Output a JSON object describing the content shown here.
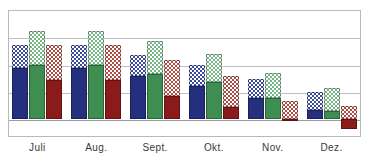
{
  "chart_data": {
    "type": "bar",
    "title": "",
    "subtitle": "",
    "xlabel": "",
    "ylabel": "",
    "categories": [
      "Juli",
      "Aug.",
      "Sept.",
      "Okt.",
      "Nov.",
      "Dez."
    ],
    "grid": true,
    "legend_position": "none",
    "ylim": [
      -0.6,
      4.6
    ],
    "gridline_values": [
      4.6,
      3.6,
      2.6,
      1.6,
      0.6,
      -0.6
    ],
    "zero_baseline": 0,
    "stacked": true,
    "series": [
      {
        "name": "blue-solid",
        "color": "#24307e",
        "pattern": "solid",
        "values": [
          2.1,
          2.1,
          1.75,
          1.35,
          0.85,
          0.37
        ]
      },
      {
        "name": "blue-checkered",
        "color": "#3a4a9c",
        "pattern": "checkered",
        "values": [
          0.93,
          0.93,
          0.88,
          0.85,
          0.8,
          0.74
        ]
      },
      {
        "name": "green-solid",
        "color": "#3e8e52",
        "pattern": "solid",
        "values": [
          2.2,
          2.2,
          1.85,
          1.5,
          0.85,
          0.33
        ]
      },
      {
        "name": "green-checkered",
        "color": "#74b583",
        "pattern": "checkered",
        "values": [
          1.4,
          1.4,
          1.35,
          1.15,
          1.05,
          0.95
        ]
      },
      {
        "name": "red-solid",
        "color": "#8b1a1a",
        "pattern": "solid",
        "values": [
          1.6,
          1.6,
          0.95,
          0.5,
          -0.08,
          -0.42
        ]
      },
      {
        "name": "red-checkered",
        "color": "#b04b44",
        "pattern": "checkered",
        "values": [
          1.45,
          1.45,
          1.45,
          1.25,
          0.75,
          0.55
        ]
      }
    ],
    "bar_colors": {
      "blue_solid": "#24307e",
      "blue_checkered": "#3a4a9c",
      "green_solid": "#3e8e52",
      "green_checkered": "#74b583",
      "red_solid": "#8b1a1a",
      "red_checkered": "#b04b44"
    },
    "axis_color": "#b9b9bd",
    "grid_color": "#bfbfc4"
  }
}
